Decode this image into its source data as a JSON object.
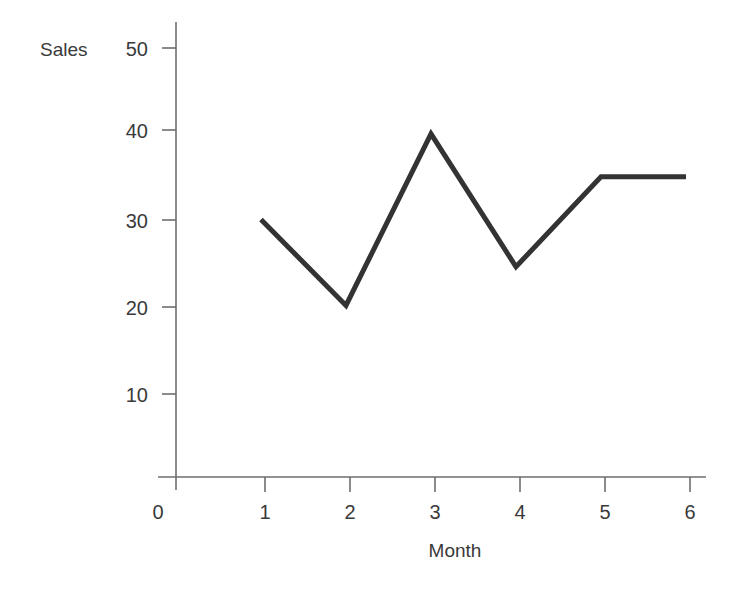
{
  "chart_data": {
    "type": "line",
    "title": "",
    "xlabel": "Month",
    "ylabel": "Sales",
    "x": [
      1,
      2,
      3,
      4,
      5,
      6
    ],
    "values": [
      30,
      20,
      40,
      24.5,
      35,
      35
    ],
    "series": [
      {
        "name": "Sales",
        "values": [
          30,
          20,
          40,
          24.5,
          35,
          35
        ]
      }
    ],
    "xlim": [
      0,
      6
    ],
    "ylim": [
      0,
      50
    ],
    "xticks": [
      "1",
      "2",
      "3",
      "4",
      "5",
      "6"
    ],
    "yticks": [
      "10",
      "20",
      "30",
      "40",
      "50"
    ],
    "origin_label": "0",
    "grid": false,
    "legend": false,
    "line_color": "#333333",
    "axis_color": "#6e6e6e",
    "line_width": 5
  },
  "axes": {
    "y_label": "Sales",
    "x_label": "Month",
    "origin_label": "0",
    "y_ticks": [
      {
        "label": "50",
        "value": 50
      },
      {
        "label": "40",
        "value": 40
      },
      {
        "label": "30",
        "value": 30
      },
      {
        "label": "20",
        "value": 20
      },
      {
        "label": "10",
        "value": 10
      }
    ],
    "x_ticks": [
      {
        "label": "1",
        "value": 1
      },
      {
        "label": "2",
        "value": 2
      },
      {
        "label": "3",
        "value": 3
      },
      {
        "label": "4",
        "value": 4
      },
      {
        "label": "5",
        "value": 5
      },
      {
        "label": "6",
        "value": 6
      }
    ]
  }
}
